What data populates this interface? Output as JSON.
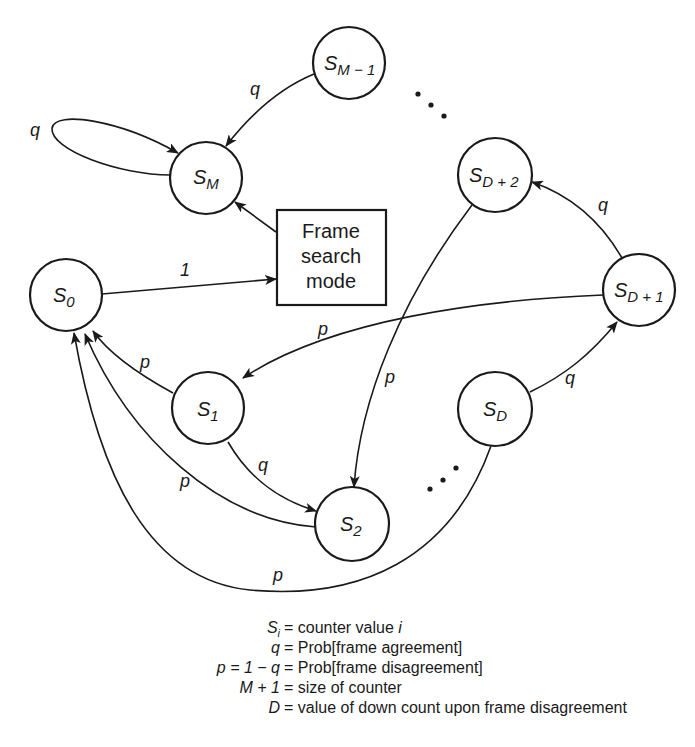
{
  "diagram": {
    "nodes": [
      {
        "id": "S_M-1",
        "base": "S",
        "sub": "M − 1",
        "cx": 349,
        "cy": 63
      },
      {
        "id": "S_M",
        "base": "S",
        "sub": "M",
        "cx": 206,
        "cy": 178
      },
      {
        "id": "S_D+2",
        "base": "S",
        "sub": "D + 2",
        "cx": 495,
        "cy": 175
      },
      {
        "id": "S_0",
        "base": "S",
        "sub": "0",
        "cx": 66,
        "cy": 295
      },
      {
        "id": "S_D+1",
        "base": "S",
        "sub": "D + 1",
        "cx": 639,
        "cy": 290
      },
      {
        "id": "S_1",
        "base": "S",
        "sub": "1",
        "cx": 208,
        "cy": 408
      },
      {
        "id": "S_D",
        "base": "S",
        "sub": "D",
        "cx": 495,
        "cy": 409
      },
      {
        "id": "S_2",
        "base": "S",
        "sub": "2",
        "cx": 352,
        "cy": 524
      }
    ],
    "box": {
      "label_lines": [
        "Frame",
        "search",
        "mode"
      ]
    },
    "edges": [
      {
        "from": "S_M-1",
        "to": "S_M",
        "label": "q"
      },
      {
        "from": "S_M",
        "to": "S_M",
        "label": "q"
      },
      {
        "from": "Frame search mode",
        "to": "S_M",
        "label": ""
      },
      {
        "from": "S_0",
        "to": "Frame search mode",
        "label": "1"
      },
      {
        "from": "S_D+1",
        "to": "S_D+2",
        "label": "q"
      },
      {
        "from": "S_D+1",
        "to": "S_1",
        "label": "p"
      },
      {
        "from": "S_D+2",
        "to": "S_2",
        "label": "p"
      },
      {
        "from": "S_D",
        "to": "S_D+1",
        "label": "q"
      },
      {
        "from": "S_1",
        "to": "S_0",
        "label": "p"
      },
      {
        "from": "S_1",
        "to": "S_2",
        "label": "q"
      },
      {
        "from": "S_2",
        "to": "S_0",
        "label": "p"
      },
      {
        "from": "S_D",
        "to": "S_0",
        "label": "p"
      }
    ],
    "ellipsis": "…"
  },
  "legend": [
    {
      "lhs": "S_i",
      "eq": "=",
      "rhs": "counter value i"
    },
    {
      "lhs": "q",
      "eq": "=",
      "rhs": "Prob[frame agreement]"
    },
    {
      "lhs": "p = 1 − q",
      "eq": "=",
      "rhs": "Prob[frame disagreement]"
    },
    {
      "lhs": "M + 1",
      "eq": "=",
      "rhs": "size of counter"
    },
    {
      "lhs": "D",
      "eq": "=",
      "rhs": "value of down count upon frame disagreement"
    }
  ],
  "labels": {
    "s": "S",
    "sub_m1": "M − 1",
    "sub_m": "M",
    "sub_d2": "D + 2",
    "sub_0": "0",
    "sub_d1": "D + 1",
    "sub_1": "1",
    "sub_d": "D",
    "sub_2": "2",
    "q": "q",
    "p": "p",
    "one": "1",
    "box1": "Frame",
    "box2": "search",
    "box3": "mode",
    "leg_si_s": "S",
    "leg_si_i": "i",
    "leg_si_rhs": "= counter value ",
    "leg_si_rhs_i": "i",
    "leg_q_lhs": "q",
    "leg_q_rhs": "= Prob[frame agreement]",
    "leg_p_lhs": "p = 1 − q",
    "leg_p_rhs": "= Prob[frame disagreement]",
    "leg_m_lhs": "M + 1",
    "leg_m_rhs": "= size of counter",
    "leg_d_lhs": "D",
    "leg_d_rhs": "= value of down count upon frame disagreement"
  }
}
